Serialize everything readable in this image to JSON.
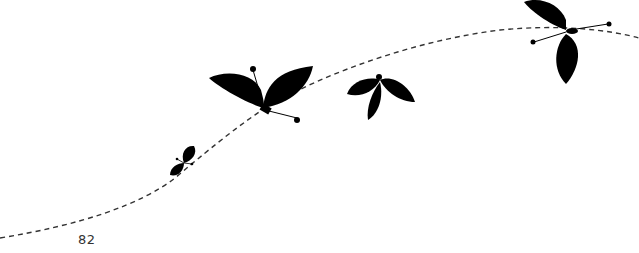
{
  "page": {
    "page_number": "82"
  },
  "illustration": {
    "description": "Silhouette butterflies with leaf-shaped wings following a dashed flight path",
    "path_color": "#333333",
    "silhouette_color": "#000000",
    "butterflies": [
      {
        "id": "small",
        "x": 184,
        "y": 163
      },
      {
        "id": "large-left",
        "x": 265,
        "y": 97
      },
      {
        "id": "middle",
        "x": 380,
        "y": 95
      },
      {
        "id": "top-right",
        "x": 565,
        "y": 40
      }
    ]
  }
}
